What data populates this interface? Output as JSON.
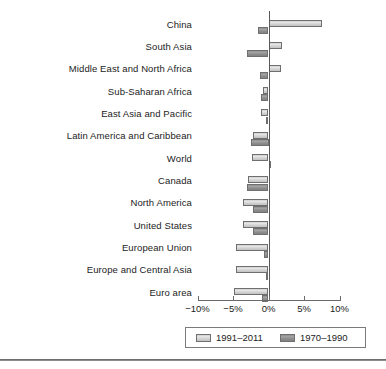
{
  "chart_data": {
    "type": "bar",
    "orientation": "horizontal",
    "title": "",
    "subtitle": "",
    "xlabel": "",
    "ylabel": "",
    "xlim": [
      -10,
      10
    ],
    "grid": false,
    "legend_position": "bottom",
    "categories": [
      "China",
      "South Asia",
      "Middle East and North Africa",
      "Sub-Saharan Africa",
      "East Asia and Pacific",
      "Latin America and Caribbean",
      "World",
      "Canada",
      "North America",
      "United States",
      "European Union",
      "Europe and Central Asia",
      "Euro area"
    ],
    "series": [
      {
        "name": "1991–2011",
        "color": "#d8d8d8",
        "values": [
          7.5,
          1.9,
          1.7,
          -0.8,
          -1.1,
          -2.2,
          -2.3,
          -2.9,
          -3.6,
          -3.6,
          -4.6,
          -4.6,
          -4.8
        ]
      },
      {
        "name": "1970–1990",
        "color": "#8f8f8f",
        "values": [
          -1.5,
          -3.0,
          -1.2,
          -1.1,
          -0.3,
          -2.5,
          0.4,
          -3.0,
          -2.2,
          -2.2,
          -0.7,
          -0.3,
          -0.9
        ]
      }
    ],
    "xticks": [
      -10,
      -5,
      0,
      5,
      10
    ],
    "xtick_labels": [
      "−10%",
      "−5%",
      "0%",
      "5%",
      "10%"
    ]
  },
  "legend": {
    "entries": [
      {
        "label": "1991–2011",
        "swatch": "light-gray-swatch"
      },
      {
        "label": "1970–1990",
        "swatch": "dark-gray-swatch"
      }
    ]
  }
}
